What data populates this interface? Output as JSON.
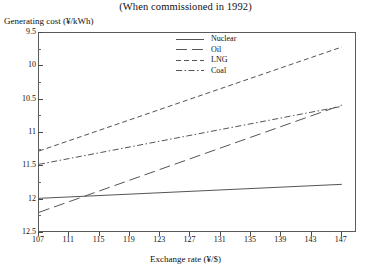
{
  "chart_data": {
    "type": "line",
    "title": "(When commissioned in 1992)",
    "xlabel": "Exchange rate (¥/$)",
    "ylabel": "Generating cost (¥/kWh)",
    "xlim": [
      107,
      149
    ],
    "ylim": [
      9.5,
      12.5
    ],
    "xticks": [
      107,
      111,
      115,
      119,
      123,
      127,
      131,
      135,
      139,
      143,
      147
    ],
    "yticks": [
      9.5,
      10,
      10.5,
      11,
      11.5,
      12,
      12.5
    ],
    "grid": false,
    "legend_position": "top-center",
    "x": [
      107,
      147
    ],
    "series": [
      {
        "name": "Nuclear",
        "label": "Nuclear",
        "values": [
          10.02,
          10.23
        ],
        "style": "solid",
        "color": "#555555"
      },
      {
        "name": "Oil",
        "label": "Oil",
        "values": [
          9.81,
          11.42
        ],
        "style": "long-dash",
        "color": "#555555"
      },
      {
        "name": "LNG",
        "label": "LNG",
        "values": [
          10.73,
          12.29
        ],
        "style": "dash-gap",
        "color": "#555555"
      },
      {
        "name": "Coal",
        "label": "Coal",
        "values": [
          10.53,
          11.4
        ],
        "style": "dash-dot",
        "color": "#555555"
      }
    ]
  },
  "axis": {
    "ytick_labels": [
      "12.5",
      "12",
      "11.5",
      "11",
      "10.5",
      "10",
      "9.5"
    ],
    "xtick_labels": [
      "107",
      "111",
      "115",
      "119",
      "123",
      "127",
      "131",
      "135",
      "139",
      "143",
      "147"
    ]
  },
  "legend": {
    "items": [
      {
        "label": "Nuclear"
      },
      {
        "label": "Oil"
      },
      {
        "label": "LNG"
      },
      {
        "label": "Coal"
      }
    ]
  }
}
